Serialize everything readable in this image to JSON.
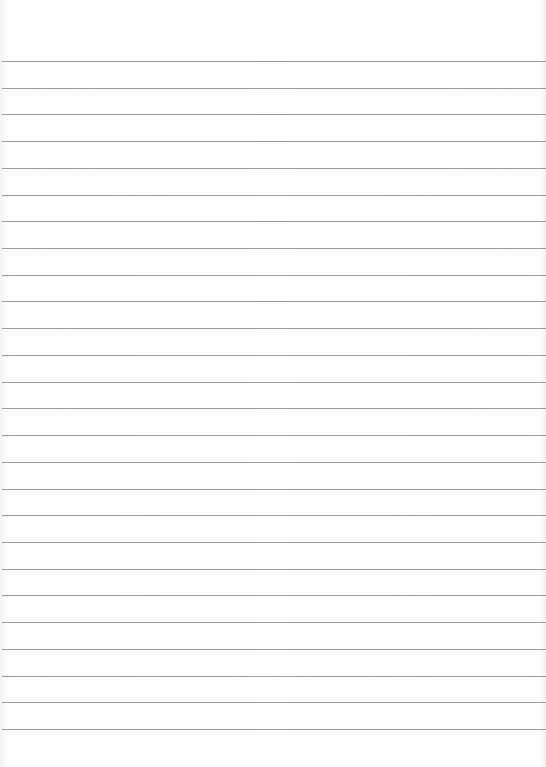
{
  "paper": {
    "type": "lined",
    "line_count": 26,
    "first_line_y": 61,
    "line_spacing": 26.72,
    "line_color": "#9a9a9a",
    "background": "#fdfdfd"
  }
}
